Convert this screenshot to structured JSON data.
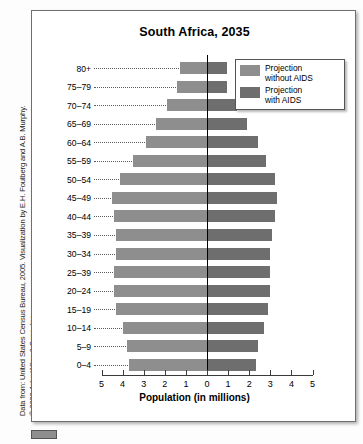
{
  "attribution": {
    "line1": "Data from: United States Census Bureau, 2005. Visualization by E.H. Foulberg and A.B. Murphy.",
    "line2": "© 2020 John Wiley & Sons, Inc."
  },
  "chart_data": {
    "type": "bar",
    "title": "South Africa, 2035",
    "xlabel": "Population (in millions)",
    "ylabel": "",
    "xlim": [
      -5,
      5
    ],
    "grid": false,
    "legend_position": "top-right",
    "axis_tick_labels": [
      "5",
      "4",
      "3",
      "2",
      "1",
      "0",
      "1",
      "2",
      "3",
      "4",
      "5"
    ],
    "axis_tick_values": [
      -5,
      -4,
      -3,
      -2,
      -1,
      0,
      1,
      2,
      3,
      4,
      5
    ],
    "categories": [
      "80+",
      "75–79",
      "70–74",
      "65–69",
      "60–64",
      "55–59",
      "50–54",
      "45–49",
      "40–44",
      "35–39",
      "30–34",
      "25–39",
      "20–24",
      "15–19",
      "10–14",
      "5–9",
      "0–4"
    ],
    "series": [
      {
        "name": "Projection without AIDS",
        "color": "#8e8e8e",
        "side": "left",
        "values": [
          1.3,
          1.4,
          1.9,
          2.4,
          2.9,
          3.5,
          4.1,
          4.5,
          4.4,
          4.3,
          4.3,
          4.4,
          4.4,
          4.3,
          4.0,
          3.8,
          3.7
        ]
      },
      {
        "name": "Projection with AIDS",
        "color": "#6e6e6e",
        "side": "right",
        "values": [
          0.95,
          0.95,
          1.4,
          1.9,
          2.4,
          2.8,
          3.2,
          3.3,
          3.2,
          3.1,
          3.0,
          3.0,
          3.0,
          2.9,
          2.7,
          2.4,
          2.3
        ]
      }
    ]
  },
  "legend": {
    "items": [
      {
        "label": "Projection\nwithout AIDS",
        "swatch": "sw-light"
      },
      {
        "label": "Projection\nwith AIDS",
        "swatch": "sw-dark"
      }
    ]
  }
}
